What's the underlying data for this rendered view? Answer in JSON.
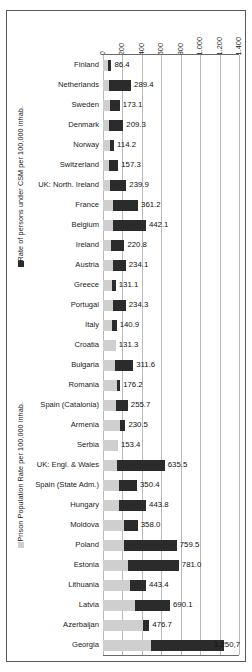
{
  "chart_data": {
    "type": "bar",
    "orientation": "horizontal",
    "stacked": true,
    "title": "",
    "xlabel": "",
    "ylabel": "",
    "xlim": [
      0,
      1400
    ],
    "grid": true,
    "legend_position": "left-rotated",
    "xticks": [
      "0",
      "200",
      "400",
      "600",
      "800",
      "1.000",
      "1.200",
      "1.400"
    ],
    "xtick_values": [
      0,
      200,
      400,
      600,
      800,
      1000,
      1200,
      1400
    ],
    "series": [
      {
        "name": "Prison Population Rate per 100,000 inhab.",
        "color": "#cfcfcf",
        "values": [
          52.9,
          61.4,
          68.2,
          64.1,
          72.3,
          66.5,
          75.8,
          98.6,
          105.2,
          84.7,
          99.3,
          90.1,
          101.4,
          91.6,
          131.3,
          120.7,
          140.9,
          132.5,
          176.1,
          153.4,
          148.2,
          163.8,
          168.9,
          212.4,
          215.5,
          252.3,
          278.6,
          326.4,
          415.7,
          497.2
        ],
        "note": "light gray lower segment of each stacked bar"
      },
      {
        "name": "Rate of persons under CSM per 100,000 inhab.",
        "color": "#2b2b2b",
        "values": [
          33.5,
          228.0,
          104.9,
          145.2,
          41.9,
          90.8,
          164.1,
          262.6,
          336.9,
          136.1,
          134.8,
          41.0,
          132.9,
          49.3,
          0.0,
          190.9,
          36.1,
          123.3,
          54.4,
          0.0,
          487.3,
          186.6,
          274.9,
          145.6,
          543.9,
          528.7,
          164.8,
          363.7,
          61.0,
          753.5
        ],
        "note": "dark upper segment of each stacked bar"
      }
    ],
    "categories": [
      "Finland",
      "Netherlands",
      "Sweden",
      "Denmark",
      "Norway",
      "Switzerland",
      "UK: North. Ireland",
      "France",
      "Belgium",
      "Ireland",
      "Austria",
      "Greece",
      "Portugal",
      "Italy",
      "Croatia",
      "Bulgaria",
      "Romania",
      "Spain (Catalonia)",
      "Armenia",
      "Serbia",
      "UK: Engl. & Wales",
      "Spain (State Adm.)",
      "Hungary",
      "Moldova",
      "Poland",
      "Estonia",
      "Lithuania",
      "Latvia",
      "Azerbaijan",
      "Georgia"
    ],
    "data_labels": [
      "86.4",
      "289.4",
      "173.1",
      "209.3",
      "114.2",
      "157.3",
      "239.9",
      "361.2",
      "442.1",
      "220.8",
      "234.1",
      "131.1",
      "234.3",
      "140.9",
      "131.3",
      "311.6",
      "176.2",
      "255.7",
      "230.5",
      "153.4",
      "635.5",
      "350.4",
      "443.8",
      "358.0",
      "759.5",
      "781.0",
      "443.4",
      "690.1",
      "476.7",
      "1.250,7"
    ],
    "total_values": [
      86.4,
      289.4,
      173.1,
      209.3,
      114.2,
      157.3,
      239.9,
      361.2,
      442.1,
      220.8,
      234.1,
      131.1,
      234.3,
      140.9,
      131.3,
      311.6,
      176.2,
      255.7,
      230.5,
      153.4,
      635.5,
      350.4,
      443.8,
      358.0,
      759.5,
      781.0,
      443.4,
      690.1,
      476.7,
      1250.7
    ]
  },
  "legend": {
    "csm_label": "Rate of persons under CSM per 100,000 inhab.",
    "ppr_label": "Prison Population Rate per 100,000 inhab.",
    "csm_color": "#2b2b2b",
    "ppr_color": "#cfcfcf"
  }
}
